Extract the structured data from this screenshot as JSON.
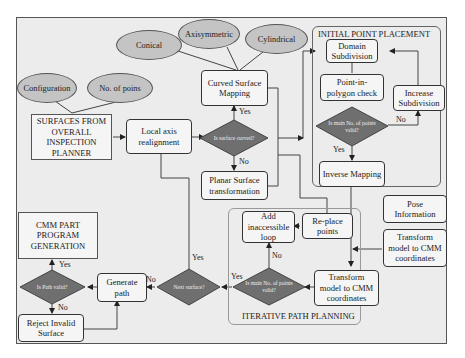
{
  "diagram": {
    "type": "flowchart",
    "colors": {
      "background": "#ececec",
      "box_fill": "#f5f5f5",
      "ellipse_fill": "#c4c4c4",
      "diamond_fill": "#6f6f6f",
      "line": "#333333"
    },
    "groups": {
      "initial_point_placement": "INITIAL POINT PLACEMENT",
      "iterative_path_planning": "ITERATIVE PATH PLANNING"
    },
    "ellipses": {
      "configuration": "Configuration",
      "no_of_points": "No. of poins",
      "conical": "Conical",
      "axisymmetric": "Axisymmetric",
      "cylindrical": "Cylindrical"
    },
    "boxes": {
      "surfaces_from_planner": "SURFACES FROM OVERALL INSPECTION PLANNER",
      "local_axis": "Local axis realignment",
      "curved_surface_mapping": "Curved Surface Mapping",
      "planar_surface": "Planar Surface transformation",
      "domain_subdivision": "Domain Subdivision",
      "point_in_polygon": "Point-in-polygon check",
      "increase_subdivision": "Increase Subdivision",
      "inverse_mapping": "Inverse Mapping",
      "pose_information": "Pose Information",
      "transform_cmm_right": "Transform model to CMM coordinates",
      "transform_cmm_iter": "Transform model to CMM coordinates",
      "add_inaccessible": "Add inaccessible loop",
      "replace_points": "Re-place points",
      "generate_path": "Generate path",
      "cmm_part_program": "CMM PART PROGRAM GENERATION",
      "reject_invalid": "Reject Invalid Surface"
    },
    "decisions": {
      "is_surface_curved": "Is surface curved?",
      "is_main_no_valid_initial": "Is main No. of points valid?",
      "is_main_no_valid_iter": "Is main No. of points valid?",
      "next_surface": "Next surface?",
      "is_path_valid": "Is Path valid?"
    },
    "edge_labels": {
      "curved_yes": "Yes",
      "curved_no": "No",
      "initial_no": "No",
      "initial_yes": "Yes",
      "iter_no": "No",
      "iter_yes": "Yes",
      "next_yes": "Yes",
      "next_no": "No",
      "path_yes": "Yes",
      "path_no": "No"
    }
  }
}
